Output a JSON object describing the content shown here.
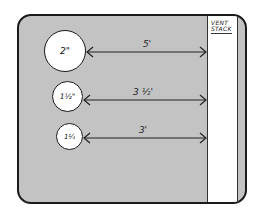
{
  "diagram": {
    "vent_stack": {
      "label_line1": "VENT",
      "label_line2": "STACK"
    },
    "pipes": [
      {
        "size": "2\"",
        "distance": "5'"
      },
      {
        "size": "1½\"",
        "distance": "3 ½'"
      },
      {
        "size": "1¼",
        "distance": "3'"
      }
    ],
    "colors": {
      "background": "#c3c3c3",
      "stack": "#ffffff",
      "outline": "#1a1a1a"
    }
  }
}
